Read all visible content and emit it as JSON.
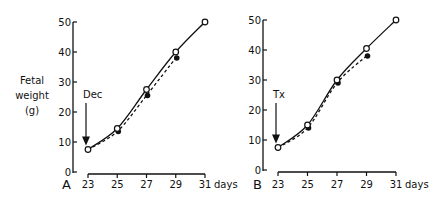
{
  "ylabel_lines": [
    "Fetal",
    "weight",
    "(g)"
  ],
  "chart_data": [
    {
      "type": "line",
      "panel": "A",
      "annotation": "Dec",
      "annotation_x": 23,
      "xlabel": "days",
      "ylabel": "Fetal weight (g)",
      "x": [
        23,
        25,
        27,
        29,
        31
      ],
      "xticks": [
        "23",
        "25",
        "27",
        "29",
        "31"
      ],
      "yticks": [
        "0",
        "10",
        "20",
        "30",
        "40",
        "50"
      ],
      "ylim": [
        0,
        50
      ],
      "grid": false,
      "series": [
        {
          "name": "control (open circles, solid line)",
          "x": [
            23,
            25,
            27,
            29,
            31
          ],
          "values": [
            7.5,
            14.5,
            27.5,
            40,
            50
          ]
        },
        {
          "name": "treated (filled circles, dashed line)",
          "x": [
            23,
            25,
            27,
            29
          ],
          "values": [
            7.5,
            13.5,
            25.5,
            38
          ]
        }
      ]
    },
    {
      "type": "line",
      "panel": "B",
      "annotation": "Tx",
      "annotation_x": 23,
      "xlabel": "days",
      "ylabel": "Fetal weight (g)",
      "x": [
        23,
        25,
        27,
        29,
        31
      ],
      "xticks": [
        "23",
        "25",
        "27",
        "29",
        "31"
      ],
      "yticks": [
        "0",
        "10",
        "20",
        "30",
        "40",
        "50"
      ],
      "ylim": [
        0,
        50
      ],
      "grid": false,
      "series": [
        {
          "name": "control (open circles, solid line)",
          "x": [
            23,
            25,
            27,
            29,
            31
          ],
          "values": [
            7.5,
            15,
            30,
            40.5,
            50
          ]
        },
        {
          "name": "treated (filled circles, dashed line)",
          "x": [
            23,
            25,
            27,
            29
          ],
          "values": [
            7.5,
            14,
            29,
            38
          ]
        }
      ]
    }
  ]
}
